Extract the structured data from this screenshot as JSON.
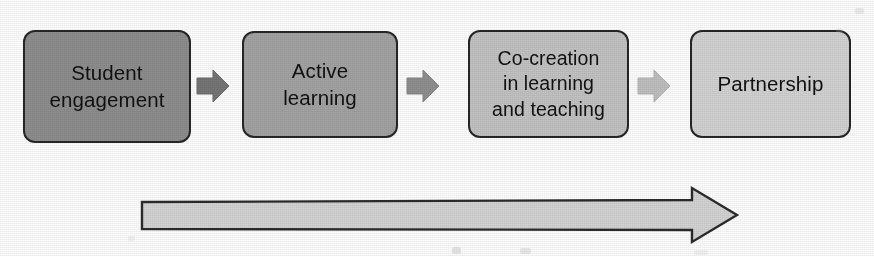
{
  "diagram": {
    "type": "linear-process-flow",
    "title": "",
    "orientation": "left-to-right",
    "stage_count": 4,
    "stages": [
      {
        "index": 1,
        "label": "Student\nengagement",
        "fill": "#8e8e8e",
        "border": "#262626"
      },
      {
        "index": 2,
        "label": "Active\nlearning",
        "fill": "#a3a3a3",
        "border": "#262626"
      },
      {
        "index": 3,
        "label": "Co-creation\nin learning\nand teaching",
        "fill": "#c3c3c3",
        "border": "#262626"
      },
      {
        "index": 4,
        "label": "Partnership",
        "fill": "#d3d3d3",
        "border": "#262626"
      }
    ],
    "connectors": [
      {
        "index": 1,
        "from": "Student engagement",
        "to": "Active learning",
        "icon": "right-block-arrow-icon",
        "fill": "#767676"
      },
      {
        "index": 2,
        "from": "Active learning",
        "to": "Co-creation in learning and teaching",
        "icon": "right-block-arrow-icon",
        "fill": "#8f8f8f"
      },
      {
        "index": 3,
        "from": "Co-creation in learning and teaching",
        "to": "Partnership",
        "icon": "right-block-arrow-icon",
        "fill": "#c0c0c0"
      }
    ],
    "progression_arrow": {
      "label": "",
      "icon": "long-right-block-arrow-icon",
      "direction": "left-to-right",
      "fill": "#d4d4d4",
      "border": "#2b2b2b",
      "spans_stages": "1-4"
    },
    "colors": {
      "background": "#ffffff",
      "text": "#111111",
      "outline": "#262626"
    }
  }
}
